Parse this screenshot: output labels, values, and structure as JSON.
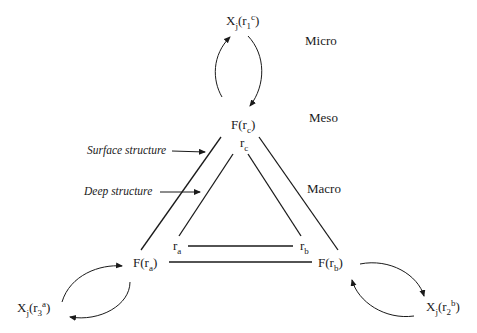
{
  "levels": {
    "micro": "Micro",
    "meso": "Meso",
    "macro": "Macro"
  },
  "annotations": {
    "surface": "Surface structure",
    "deep": "Deep structure"
  },
  "nodes": {
    "top_x": {
      "base": "X",
      "sub": "j",
      "open": "(r",
      "inner_sub": "1",
      "sup": "c",
      "close": ")"
    },
    "left_x": {
      "base": "X",
      "sub": "j",
      "open": "(r",
      "inner_sub": "3",
      "sup": "a",
      "close": ")"
    },
    "right_x": {
      "base": "X",
      "sub": "j",
      "open": "(r",
      "inner_sub": "2",
      "sup": "b",
      "close": ")"
    },
    "f_c": {
      "base": "F(r",
      "sub": "c",
      "close": ")"
    },
    "f_a": {
      "base": "F(r",
      "sub": "a",
      "close": ")"
    },
    "f_b": {
      "base": "F(r",
      "sub": "b",
      "close": ")"
    },
    "r_c": {
      "base": "r",
      "sub": "c"
    },
    "r_a": {
      "base": "r",
      "sub": "a"
    },
    "r_b": {
      "base": "r",
      "sub": "b"
    }
  },
  "colors": {
    "line": "#1a1a1a",
    "background": "#ffffff"
  }
}
